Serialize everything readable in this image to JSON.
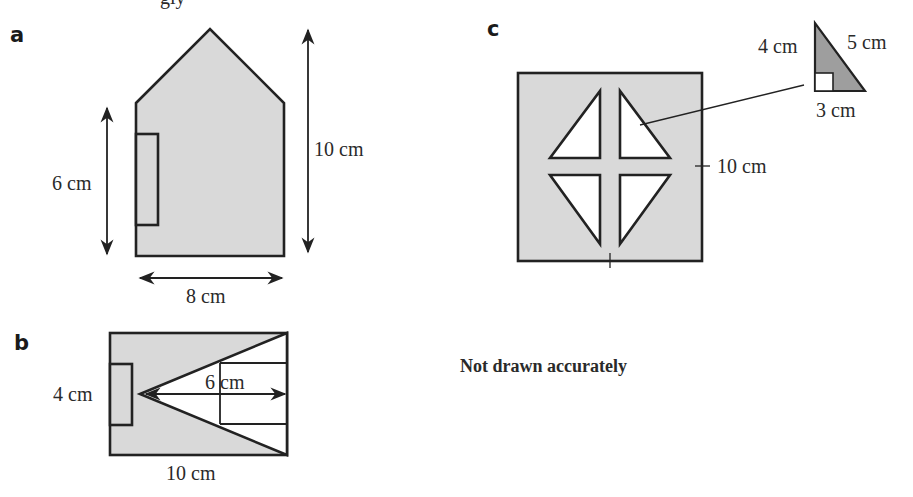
{
  "header": {
    "clipped_text": "gly"
  },
  "parts": {
    "a": {
      "label": "a",
      "dims": {
        "height_total": "10 cm",
        "wall_height": "6 cm",
        "width": "8 cm"
      }
    },
    "b": {
      "label": "b",
      "dims": {
        "height": "4 cm",
        "inner": "6 cm",
        "width": "10 cm"
      }
    },
    "c": {
      "label": "c",
      "dims": {
        "side": "10 cm"
      },
      "triangle": {
        "leg_vertical": "4 cm",
        "leg_horizontal": "3 cm",
        "hypotenuse": "5 cm"
      }
    }
  },
  "note": "Not drawn accurately",
  "colors": {
    "fill": "#d9d9d9",
    "stroke": "#222222",
    "background": "#ffffff"
  }
}
